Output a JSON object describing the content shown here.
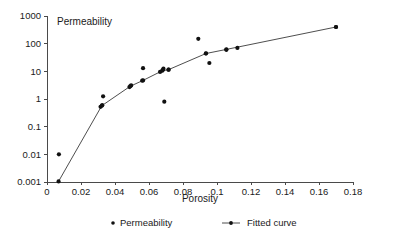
{
  "chart_data": {
    "type": "scatter",
    "title": "Permeability",
    "xlabel": "Porosity",
    "ylabel": "",
    "yscale": "log",
    "xscale": "linear",
    "xlim": [
      0,
      0.18
    ],
    "ylim": [
      0.001,
      1000
    ],
    "grid": false,
    "legend_position": "bottom",
    "xticks": [
      0,
      0.02,
      0.04,
      0.06,
      0.08,
      0.1,
      0.12,
      0.14,
      0.16,
      0.18
    ],
    "xtick_labels": [
      "0",
      "0.02",
      "0.04",
      "0.06",
      "0.08",
      "0.1",
      "0.12",
      "0.14",
      "0.16",
      "0.18"
    ],
    "yticks": [
      0.001,
      0.01,
      0.1,
      1,
      10,
      100,
      1000
    ],
    "ytick_labels": [
      "0.001",
      "0.01",
      "0.1",
      "1",
      "10",
      "100",
      "1000"
    ],
    "series": [
      {
        "name": "Permeability",
        "type": "scatter",
        "marker": "circle",
        "color": "#111111",
        "points": [
          {
            "x": 0.007,
            "y": 0.01
          },
          {
            "x": 0.0315,
            "y": 0.52
          },
          {
            "x": 0.0325,
            "y": 0.6
          },
          {
            "x": 0.033,
            "y": 1.25
          },
          {
            "x": 0.0485,
            "y": 2.7
          },
          {
            "x": 0.0495,
            "y": 3.1
          },
          {
            "x": 0.056,
            "y": 4.6
          },
          {
            "x": 0.0565,
            "y": 13.0
          },
          {
            "x": 0.0665,
            "y": 9.5
          },
          {
            "x": 0.068,
            "y": 11.0
          },
          {
            "x": 0.0685,
            "y": 12.5
          },
          {
            "x": 0.069,
            "y": 0.8
          },
          {
            "x": 0.0715,
            "y": 11.5
          },
          {
            "x": 0.089,
            "y": 150.0
          },
          {
            "x": 0.0935,
            "y": 45.0
          },
          {
            "x": 0.0955,
            "y": 20.0
          },
          {
            "x": 0.1055,
            "y": 60.0
          },
          {
            "x": 0.112,
            "y": 70.0
          },
          {
            "x": 0.17,
            "y": 400.0
          }
        ]
      },
      {
        "name": "Fitted curve",
        "type": "line",
        "marker": "circle",
        "color": "#3a3a3a",
        "points": [
          {
            "x": 0.0068,
            "y": 0.00105
          },
          {
            "x": 0.0322,
            "y": 0.57
          },
          {
            "x": 0.049,
            "y": 2.9
          },
          {
            "x": 0.0565,
            "y": 4.7
          },
          {
            "x": 0.0678,
            "y": 10.5
          },
          {
            "x": 0.0715,
            "y": 11.5
          },
          {
            "x": 0.0935,
            "y": 44.0
          },
          {
            "x": 0.1055,
            "y": 62.0
          },
          {
            "x": 0.17,
            "y": 400.0
          }
        ]
      }
    ],
    "legend": [
      {
        "label": "Permeability",
        "marker": "dot",
        "line": false
      },
      {
        "label": "Fitted curve",
        "marker": "dot",
        "line": true
      }
    ]
  }
}
